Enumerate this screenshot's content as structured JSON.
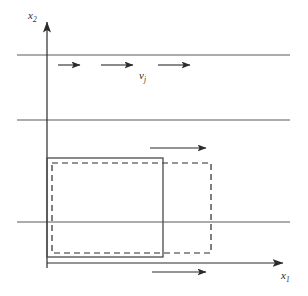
{
  "figure": {
    "kind": "schematic-diagram",
    "background_color": "#ffffff",
    "line_color": "#4a4a4a",
    "dark_line_color": "#2b2b2b",
    "width": 308,
    "height": 296
  },
  "axes": {
    "vertical": {
      "label": "x",
      "subscript": "2",
      "label_x": 30,
      "label_y": 16,
      "x": 47,
      "y_top": 18,
      "y_bottom": 268
    },
    "horizontal": {
      "label": "x",
      "subscript": "1",
      "label_x": 283,
      "label_y": 278,
      "y": 263,
      "x_left": 47,
      "x_right": 289
    }
  },
  "flow": {
    "velocity_label": "v",
    "velocity_subscript": "j",
    "velocity_label_x": 140,
    "velocity_label_y": 78,
    "stripe_lines": [
      {
        "name": "stripe-line-top",
        "y": 55,
        "x1": 17,
        "x2": 290
      },
      {
        "name": "stripe-line-middle",
        "y": 120,
        "x1": 17,
        "x2": 290
      },
      {
        "name": "stripe-line-lower",
        "y": 222,
        "x1": 17,
        "x2": 290
      }
    ],
    "flow_arrows": [
      {
        "name": "flow-arrow-1",
        "y": 65,
        "x1": 58,
        "x2": 80
      },
      {
        "name": "flow-arrow-2",
        "y": 65,
        "x1": 101,
        "x2": 133
      },
      {
        "name": "flow-arrow-3",
        "y": 65,
        "x1": 158,
        "x2": 190
      },
      {
        "name": "flow-arrow-top-body",
        "y": 148,
        "x1": 150,
        "x2": 206
      },
      {
        "name": "flow-arrow-below-axis",
        "y": 272,
        "x1": 152,
        "x2": 206
      }
    ]
  },
  "bodies": {
    "solid_rectangle": {
      "name": "reference-configuration",
      "x": 47,
      "y": 158,
      "width": 116,
      "height": 99,
      "style": "solid"
    },
    "dashed_rectangle": {
      "name": "displaced-configuration",
      "x": 52,
      "y": 163,
      "width": 159,
      "height": 90,
      "style": "dashed",
      "dash_pattern": "6 4"
    }
  }
}
